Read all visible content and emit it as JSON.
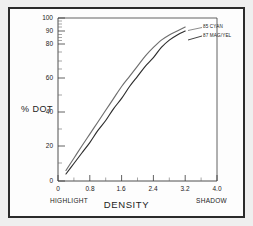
{
  "chart_data": {
    "type": "line",
    "title": "",
    "xlabel": "DENSITY",
    "ylabel": "% DOT",
    "xlim": [
      0,
      4.0
    ],
    "ylim": [
      0,
      100
    ],
    "grid": false,
    "legend_position": "right-inside-top",
    "x_axis": {
      "label": "DENSITY",
      "ticks": [
        0,
        0.8,
        1.6,
        2.4,
        3.2,
        4.0
      ],
      "tick_labels": [
        "0",
        "0.8",
        "1.6",
        "2.4",
        "3.2",
        "4.0"
      ],
      "left_annotation": "HIGHLIGHT",
      "right_annotation": "SHADOW"
    },
    "y_axis": {
      "label": "% DOT",
      "ticks": [
        0,
        20,
        40,
        60,
        80,
        90,
        100
      ],
      "tick_labels": [
        "0",
        "20",
        "40",
        "60",
        "80",
        "90",
        "100"
      ],
      "scale_note": "compressed near 100"
    },
    "series": [
      {
        "name": "85 CYAN",
        "color": "#6e6e6e",
        "x": [
          0.2,
          0.4,
          0.6,
          0.8,
          1.0,
          1.2,
          1.4,
          1.6,
          1.8,
          2.0,
          2.2,
          2.4,
          2.6,
          2.8,
          3.0,
          3.2
        ],
        "values": [
          6,
          13,
          20,
          27,
          34,
          41,
          48,
          55,
          61,
          67,
          73,
          78,
          83,
          87,
          90,
          93
        ]
      },
      {
        "name": "87 MAG/YEL",
        "color": "#2e2e2e",
        "x": [
          0.2,
          0.4,
          0.6,
          0.8,
          1.0,
          1.2,
          1.4,
          1.6,
          1.8,
          2.0,
          2.2,
          2.4,
          2.6,
          2.8,
          3.0,
          3.2
        ],
        "values": [
          4,
          10,
          16,
          22,
          29,
          35,
          42,
          48,
          55,
          61,
          67,
          72,
          78,
          83,
          87,
          90
        ]
      }
    ]
  }
}
